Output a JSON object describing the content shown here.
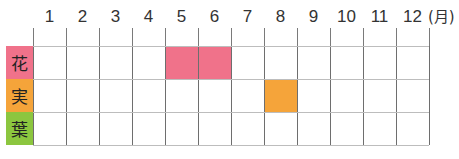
{
  "chart_data": {
    "type": "heatmap",
    "title": "",
    "xlabel": "(月)",
    "ylabel": "",
    "categories": [
      "1",
      "2",
      "3",
      "4",
      "5",
      "6",
      "7",
      "8",
      "9",
      "10",
      "11",
      "12"
    ],
    "unit_label": "(月)",
    "rows": [
      {
        "label": "花",
        "color": "#f0728a",
        "active_months": [
          5,
          6
        ],
        "values": [
          0,
          0,
          0,
          0,
          1,
          1,
          0,
          0,
          0,
          0,
          0,
          0
        ]
      },
      {
        "label": "実",
        "color": "#f5a43a",
        "active_months": [
          8
        ],
        "values": [
          0,
          0,
          0,
          0,
          0,
          0,
          0,
          1,
          0,
          0,
          0,
          0
        ]
      },
      {
        "label": "葉",
        "color": "#8cc63f",
        "active_months": [],
        "values": [
          0,
          0,
          0,
          0,
          0,
          0,
          0,
          0,
          0,
          0,
          0,
          0
        ]
      }
    ],
    "grid": true,
    "legend": "none"
  }
}
